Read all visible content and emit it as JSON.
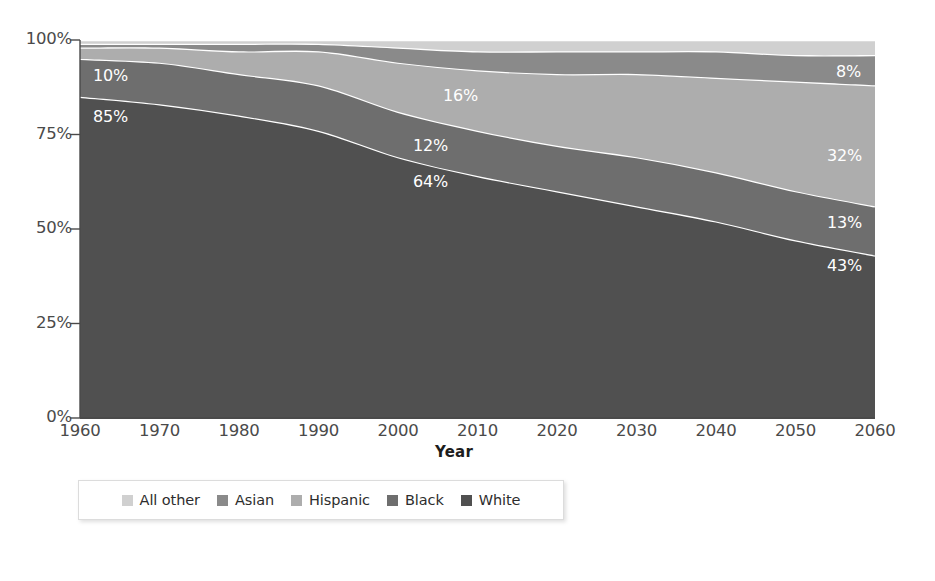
{
  "chart_data": {
    "type": "area",
    "stacked": true,
    "normalized": true,
    "title": "",
    "xlabel": "Year",
    "ylabel": "",
    "grid": false,
    "legend_position": "bottom",
    "x": [
      1960,
      1970,
      1980,
      1990,
      2000,
      2010,
      2020,
      2030,
      2040,
      2050,
      2060
    ],
    "xlim": [
      1960,
      2060
    ],
    "ylim": [
      0,
      100
    ],
    "xtick_labels": [
      "1960",
      "1970",
      "1980",
      "1990",
      "2000",
      "2010",
      "2020",
      "2030",
      "2040",
      "2050",
      "2060"
    ],
    "ytick_labels": [
      "0%",
      "25%",
      "50%",
      "75%",
      "100%"
    ],
    "ytick_values": [
      0,
      25,
      50,
      75,
      100
    ],
    "series": [
      {
        "name": "White",
        "color": "#505050",
        "values": [
          85,
          83,
          80,
          76,
          69,
          64,
          60,
          56,
          52,
          47,
          43
        ]
      },
      {
        "name": "Black",
        "color": "#6e6e6e",
        "values": [
          10,
          11,
          11,
          12,
          12,
          12,
          12,
          13,
          13,
          13,
          13
        ]
      },
      {
        "name": "Hispanic",
        "color": "#adadad",
        "values": [
          3,
          4,
          6,
          9,
          13,
          16,
          19,
          22,
          25,
          29,
          32
        ]
      },
      {
        "name": "Asian",
        "color": "#8a8a8a",
        "values": [
          1,
          1,
          2,
          2,
          4,
          5,
          6,
          6,
          7,
          7,
          8
        ]
      },
      {
        "name": "All other",
        "color": "#d0d0d0",
        "values": [
          1,
          1,
          1,
          1,
          2,
          3,
          3,
          3,
          3,
          4,
          4
        ]
      }
    ],
    "annotations": [
      {
        "text": "85%",
        "series": "White",
        "year": 1960,
        "x": 93,
        "y": 107
      },
      {
        "text": "10%",
        "series": "Black",
        "year": 1960,
        "x": 93,
        "y": 66
      },
      {
        "text": "64%",
        "series": "White",
        "year": 2000,
        "x": 413,
        "y": 172
      },
      {
        "text": "12%",
        "series": "Black",
        "year": 2000,
        "x": 413,
        "y": 136
      },
      {
        "text": "16%",
        "series": "Hispanic",
        "year": 2005,
        "x": 443,
        "y": 86
      },
      {
        "text": "43%",
        "series": "White",
        "year": 2060,
        "x": 827,
        "y": 256
      },
      {
        "text": "13%",
        "series": "Black",
        "year": 2060,
        "x": 827,
        "y": 213
      },
      {
        "text": "32%",
        "series": "Hispanic",
        "year": 2060,
        "x": 827,
        "y": 146
      },
      {
        "text": "8%",
        "series": "Asian",
        "year": 2060,
        "x": 836,
        "y": 62
      }
    ]
  },
  "axes": {
    "x_title": "Year",
    "y_ticks": [
      "100%",
      "75%",
      "50%",
      "25%",
      "0%"
    ],
    "x_ticks": [
      "1960",
      "1970",
      "1980",
      "1990",
      "2000",
      "2010",
      "2020",
      "2030",
      "2040",
      "2050",
      "2060"
    ]
  },
  "legend": {
    "items": [
      {
        "label": "All other",
        "color": "#d0d0d0"
      },
      {
        "label": "Asian",
        "color": "#8a8a8a"
      },
      {
        "label": "Hispanic",
        "color": "#adadad"
      },
      {
        "label": "Black",
        "color": "#6e6e6e"
      },
      {
        "label": "White",
        "color": "#505050"
      }
    ]
  },
  "title": ""
}
